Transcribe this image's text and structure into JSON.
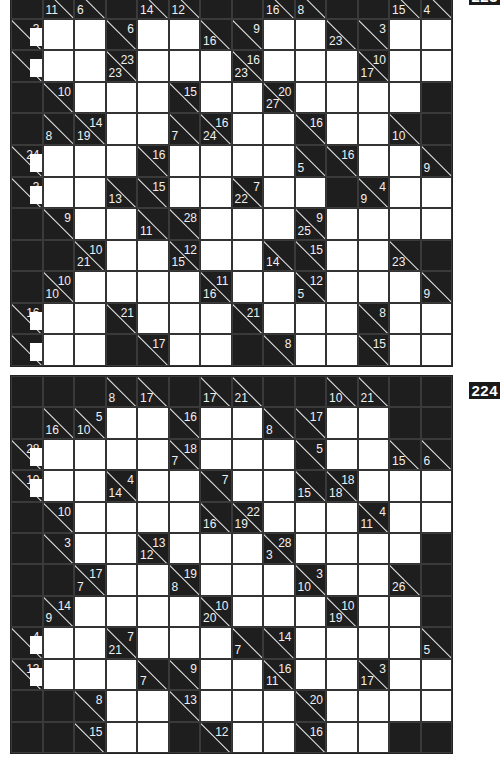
{
  "puzzles": [
    {
      "number": "223",
      "position": "top",
      "cols": 14,
      "rows": 12,
      "grid": [
        [
          "b",
          {
            "d": "11"
          },
          {
            "d": "6"
          },
          "b",
          {
            "d": "14"
          },
          {
            "d": "12"
          },
          "b",
          "b",
          {
            "d": "16"
          },
          {
            "d": "8"
          },
          "b",
          "b",
          {
            "d": "15"
          },
          {
            "d": "4"
          }
        ],
        [
          {
            "r": "3",
            "blob": true
          },
          "w",
          "w",
          {
            "r": "6"
          },
          "w",
          "w",
          {
            "d": "16"
          },
          {
            "r": "9"
          },
          "w",
          "w",
          {
            "d": "23"
          },
          {
            "r": "3"
          },
          "w",
          "w"
        ],
        [
          {
            "r": "",
            "blob": true
          },
          "w",
          "w",
          {
            "d": "23",
            "r": "23"
          },
          "w",
          "w",
          "w",
          {
            "d": "23",
            "r": "16"
          },
          "w",
          "w",
          "w",
          {
            "d": "17",
            "r": "10"
          },
          "w",
          "w"
        ],
        [
          "b",
          {
            "r": "10"
          },
          "w",
          "w",
          "w",
          {
            "r": "15"
          },
          "w",
          "w",
          {
            "d": "27",
            "r": "20"
          },
          "w",
          "w",
          "w",
          "w",
          "b"
        ],
        [
          "b",
          {
            "d": "8"
          },
          {
            "d": "19",
            "r": "14"
          },
          "w",
          "w",
          {
            "d": "7"
          },
          {
            "d": "24",
            "r": "16"
          },
          "w",
          "w",
          {
            "r": "16"
          },
          "w",
          "w",
          {
            "d": "10"
          },
          "b"
        ],
        [
          {
            "r": "24",
            "blob": true
          },
          "w",
          "w",
          "w",
          {
            "r": "16"
          },
          "w",
          "w",
          "w",
          "w",
          {
            "d": "5"
          },
          {
            "r": "16"
          },
          "w",
          "w",
          {
            "d": "9"
          }
        ],
        [
          {
            "r": "3",
            "blob": true
          },
          "w",
          "w",
          {
            "d": "13"
          },
          {
            "r": "15"
          },
          "w",
          "w",
          {
            "d": "22",
            "r": "7"
          },
          "w",
          "w",
          "b",
          {
            "d": "9",
            "r": "4"
          },
          "w",
          "w"
        ],
        [
          "b",
          {
            "r": "9"
          },
          "w",
          "w",
          {
            "d": "11"
          },
          {
            "r": "28"
          },
          "w",
          "w",
          "w",
          {
            "d": "25",
            "r": "9"
          },
          "w",
          "w",
          "w",
          "w"
        ],
        [
          "b",
          "b",
          {
            "d": "21",
            "r": "10"
          },
          "w",
          "w",
          {
            "d": "15",
            "r": "12"
          },
          "w",
          "w",
          {
            "d": "14"
          },
          {
            "r": "15"
          },
          "w",
          "w",
          {
            "d": "23"
          },
          "b"
        ],
        [
          "b",
          {
            "d": "10",
            "r": "10"
          },
          "w",
          "w",
          "w",
          "w",
          {
            "d": "16",
            "r": "11"
          },
          "w",
          "w",
          {
            "d": "5",
            "r": "12"
          },
          "w",
          "w",
          "w",
          {
            "d": "9"
          }
        ],
        [
          {
            "r": "16",
            "blob": true
          },
          "w",
          "w",
          {
            "r": "21"
          },
          "w",
          "w",
          "w",
          {
            "r": "21"
          },
          "w",
          "w",
          "w",
          {
            "r": "8"
          },
          "w",
          "w"
        ],
        [
          {
            "r": "",
            "blob": true
          },
          "w",
          "w",
          "b",
          {
            "r": "17"
          },
          "w",
          "w",
          "b",
          {
            "r": "8"
          },
          "w",
          "w",
          {
            "r": "15"
          },
          "w",
          "w"
        ]
      ]
    },
    {
      "number": "224",
      "position": "bottom",
      "cols": 14,
      "rows": 12,
      "grid": [
        [
          "b",
          "b",
          "b",
          {
            "d": "8"
          },
          {
            "d": "17"
          },
          "b",
          {
            "d": "17"
          },
          {
            "d": "21"
          },
          "b",
          "b",
          {
            "d": "10"
          },
          {
            "d": "21"
          },
          "b",
          "b"
        ],
        [
          "b",
          {
            "d": "16"
          },
          {
            "d": "10",
            "r": "5"
          },
          "w",
          "w",
          {
            "r": "16"
          },
          "w",
          "w",
          {
            "d": "8"
          },
          {
            "r": "17"
          },
          "w",
          "w",
          "b",
          "b"
        ],
        [
          {
            "r": "28",
            "blob": true
          },
          "w",
          "w",
          "w",
          "w",
          {
            "d": "7",
            "r": "18"
          },
          "w",
          "w",
          "w",
          {
            "r": "5"
          },
          "w",
          "w",
          {
            "d": "15"
          },
          {
            "d": "6"
          }
        ],
        [
          {
            "r": "10",
            "blob": true
          },
          "w",
          "w",
          {
            "d": "14",
            "r": "4"
          },
          "w",
          "w",
          {
            "r": "7"
          },
          "w",
          "w",
          {
            "d": "15"
          },
          {
            "d": "18",
            "r": "18"
          },
          "w",
          "w",
          "w"
        ],
        [
          "b",
          {
            "r": "10"
          },
          "w",
          "w",
          "w",
          "w",
          {
            "d": "16"
          },
          {
            "d": "19",
            "r": "22"
          },
          "w",
          "w",
          "w",
          {
            "d": "11",
            "r": "4"
          },
          "w",
          "w"
        ],
        [
          "b",
          {
            "r": "3"
          },
          "w",
          "w",
          {
            "d": "12",
            "r": "13"
          },
          "w",
          "w",
          "w",
          {
            "d": "3",
            "r": "28"
          },
          "w",
          "w",
          "w",
          "w",
          "b"
        ],
        [
          "b",
          "b",
          {
            "d": "7",
            "r": "17"
          },
          "w",
          "w",
          {
            "d": "8",
            "r": "19"
          },
          "w",
          "w",
          "w",
          {
            "d": "10",
            "r": "3"
          },
          "w",
          "w",
          {
            "d": "26"
          },
          "b"
        ],
        [
          "b",
          {
            "d": "9",
            "r": "14"
          },
          "w",
          "w",
          "w",
          "w",
          {
            "d": "20",
            "r": "10"
          },
          "w",
          "w",
          "w",
          {
            "d": "19",
            "r": "10"
          },
          "w",
          "w",
          "b"
        ],
        [
          {
            "r": "4",
            "blob": true
          },
          "w",
          "w",
          {
            "d": "21",
            "r": "7"
          },
          "w",
          "w",
          "w",
          {
            "d": "7"
          },
          {
            "r": "14"
          },
          "w",
          "w",
          "w",
          "w",
          {
            "d": "5"
          }
        ],
        [
          {
            "r": "13",
            "blob": true
          },
          "w",
          "w",
          "w",
          {
            "d": "7"
          },
          {
            "r": "9"
          },
          "w",
          "w",
          {
            "d": "11",
            "r": "16"
          },
          "w",
          "w",
          {
            "d": "17",
            "r": "3"
          },
          "w",
          "w"
        ],
        [
          "b",
          "b",
          {
            "r": "8"
          },
          "w",
          "w",
          {
            "r": "13"
          },
          "w",
          "w",
          "w",
          {
            "r": "20"
          },
          "w",
          "w",
          "w",
          "w"
        ],
        [
          "b",
          "b",
          {
            "r": "15"
          },
          "w",
          "w",
          "b",
          {
            "r": "12"
          },
          "w",
          "w",
          {
            "r": "16"
          },
          "w",
          "w",
          "b",
          "b"
        ]
      ]
    }
  ],
  "colors": {
    "black_cell": "#1e1e1e",
    "white_cell": "#ffffff",
    "clue_text": "#f0f0f0",
    "grid_line": "#333333"
  }
}
